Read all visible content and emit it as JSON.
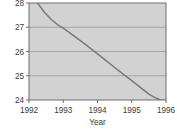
{
  "chart_data": {
    "type": "line",
    "title": "",
    "xlabel": "Year",
    "ylabel": "",
    "xlim": [
      1992,
      1996
    ],
    "ylim": [
      24,
      28
    ],
    "grid": true,
    "legend": "none",
    "xticks": [
      1992,
      1993,
      1994,
      1995,
      1996
    ],
    "xtick_labels": [
      "1992",
      "1993",
      "1994",
      "1995",
      "1996"
    ],
    "yticks": [
      24,
      25,
      26,
      27,
      28
    ],
    "ytick_labels": [
      "24",
      "25",
      "26",
      "27",
      "28"
    ],
    "gridlines_y": [
      25,
      26,
      27
    ],
    "series": [
      {
        "name": "trend",
        "color": "#7a7a7a",
        "x": [
          1992.25,
          1992.45,
          1992.65,
          1992.85,
          1993.0,
          1993.25,
          1993.5,
          1993.75,
          1994.0,
          1994.25,
          1994.5,
          1994.75,
          1995.0,
          1995.25,
          1995.5,
          1995.7,
          1995.85,
          1996.0
        ],
        "y": [
          28.0,
          27.62,
          27.32,
          27.09,
          26.96,
          26.71,
          26.45,
          26.18,
          25.9,
          25.62,
          25.34,
          25.07,
          24.8,
          24.52,
          24.24,
          24.08,
          24.0,
          23.98
        ]
      }
    ],
    "colors": {
      "plot_background": "#d2d2d2",
      "grid": "#9a9a9a",
      "frame": "#6e6e6e",
      "curve": "#7a7a7a",
      "text": "#3b3b3b",
      "page_background": "#ffffff"
    }
  },
  "axis": {
    "x_title": "Year"
  }
}
